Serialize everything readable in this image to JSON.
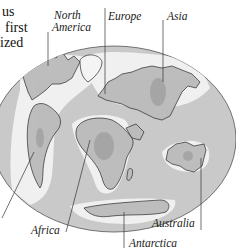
{
  "caption": {
    "lines": [
      "us",
      "first",
      "ized"
    ]
  },
  "map": {
    "projection": "oval-world",
    "colors": {
      "ocean": "#c9c9c9",
      "shelf": "#f2f2f2",
      "land": "#bdbdbd",
      "land_dark": "#9a9a9a",
      "outline": "#2a2a2a",
      "leader": "#333333"
    },
    "labels": {
      "north_america": "North\nAmerica",
      "north_america_line1": "North",
      "north_america_line2": "America",
      "europe": "Europe",
      "asia": "Asia",
      "africa": "Africa",
      "australia": "Australia",
      "antarctica": "Antarctica"
    }
  }
}
